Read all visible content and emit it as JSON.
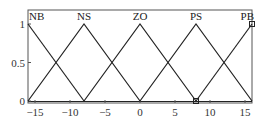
{
  "chart_data": {
    "type": "line",
    "title": "",
    "xlabel": "",
    "ylabel": "",
    "xlim": [
      -16,
      16
    ],
    "ylim": [
      0,
      1
    ],
    "grid": false,
    "legend": "none",
    "xticks": [
      -15,
      -10,
      -5,
      0,
      5,
      10,
      15
    ],
    "yticks": [
      0,
      0.5,
      1
    ],
    "xtick_labels": [
      "−15",
      "−10",
      "−5",
      "0",
      "5",
      "10",
      "15"
    ],
    "ytick_labels": [
      "0",
      "0.5",
      "1"
    ],
    "series": [
      {
        "name": "NB",
        "x": [
          -16,
          -8
        ],
        "values": [
          1,
          0
        ]
      },
      {
        "name": "NS",
        "x": [
          -16,
          -8,
          0
        ],
        "values": [
          0,
          1,
          0
        ]
      },
      {
        "name": "ZO",
        "x": [
          -8,
          0,
          8
        ],
        "values": [
          0,
          1,
          0
        ]
      },
      {
        "name": "PS",
        "x": [
          0,
          8,
          16
        ],
        "values": [
          0,
          1,
          0
        ]
      },
      {
        "name": "PB",
        "x": [
          8,
          16
        ],
        "values": [
          0,
          1
        ]
      }
    ],
    "annotations": [
      {
        "text": "NB",
        "x": -16,
        "y": 1
      },
      {
        "text": "NS",
        "x": -8,
        "y": 1
      },
      {
        "text": "ZO",
        "x": 0,
        "y": 1
      },
      {
        "text": "PS",
        "x": 8,
        "y": 1
      },
      {
        "text": "PB",
        "x": 16,
        "y": 1
      }
    ],
    "markers": [
      {
        "x": 8,
        "y": 0,
        "shape": "square"
      },
      {
        "x": 16,
        "y": 1,
        "shape": "square"
      }
    ],
    "line_color": "#222222",
    "axes_color": "#555555"
  }
}
